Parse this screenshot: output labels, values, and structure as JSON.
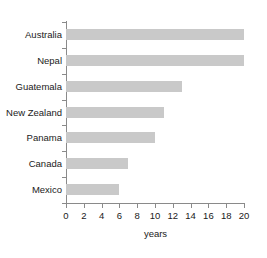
{
  "chart_data": {
    "type": "bar",
    "orientation": "horizontal",
    "title": "",
    "xlabel": "years",
    "ylabel": "",
    "categories": [
      "Australia",
      "Nepal",
      "Guatemala",
      "New Zealand",
      "Panama",
      "Canada",
      "Mexico"
    ],
    "values": [
      20,
      20,
      13,
      11,
      10,
      7,
      6
    ],
    "xlim": [
      0,
      20
    ],
    "xticks": [
      0,
      2,
      4,
      6,
      8,
      10,
      12,
      14,
      16,
      18,
      20
    ],
    "xtick_labels": [
      "0",
      "2",
      "4",
      "6",
      "8",
      "10",
      "12",
      "14",
      "16",
      "18",
      "20"
    ],
    "grid": false,
    "legend": false,
    "bar_color": "#c9c9c9",
    "axis_color": "#8a8a8a",
    "text_color": "#1a1a1a",
    "background_color": "#ffffff"
  }
}
